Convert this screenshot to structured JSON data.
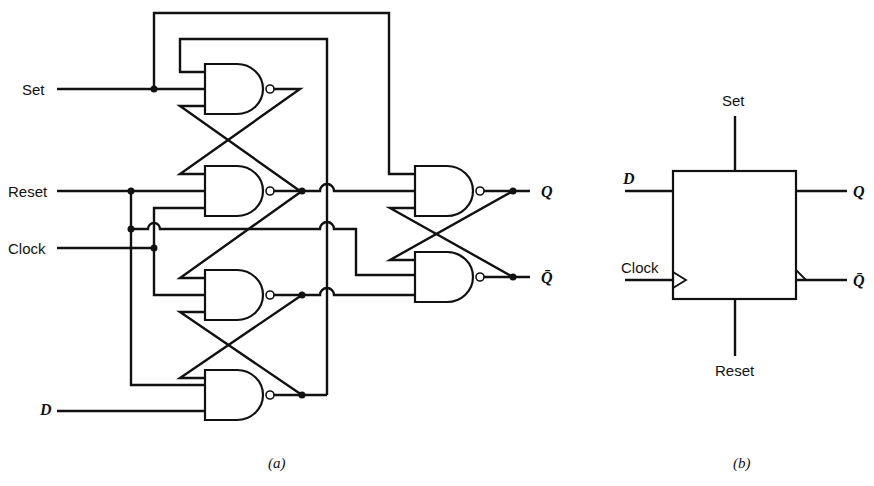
{
  "figure": {
    "panel_a": {
      "caption": "(a)",
      "inputs": [
        {
          "label": "Set"
        },
        {
          "label": "Reset"
        },
        {
          "label": "Clock"
        },
        {
          "label": "D"
        }
      ],
      "outputs": [
        {
          "label": "Q"
        },
        {
          "label": "Q̄"
        }
      ],
      "gate_type": "NAND",
      "gate_count": 6
    },
    "panel_b": {
      "caption": "(b)",
      "block": "D flip-flop",
      "top_label": "Set",
      "bottom_label": "Reset",
      "left_labels": [
        "D",
        "Clock"
      ],
      "right_labels": [
        "Q",
        "Q̄"
      ]
    }
  },
  "colors": {
    "ink": "#111111",
    "background": "#ffffff"
  }
}
